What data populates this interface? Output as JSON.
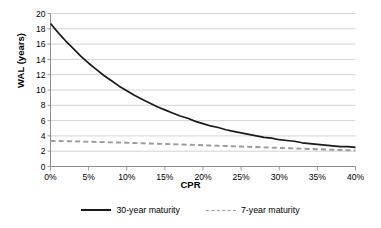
{
  "chart_data": {
    "type": "line",
    "title": "",
    "xlabel": "CPR",
    "ylabel": "WAL (years)",
    "xlim": [
      0,
      40
    ],
    "ylim": [
      0,
      20
    ],
    "xticks": [
      0,
      5,
      10,
      15,
      20,
      25,
      30,
      35,
      40
    ],
    "xticklabels": [
      "0%",
      "5%",
      "10%",
      "15%",
      "20%",
      "25%",
      "30%",
      "35%",
      "40%"
    ],
    "yticks": [
      0,
      2,
      4,
      6,
      8,
      10,
      12,
      14,
      16,
      18,
      20
    ],
    "yticklabels": [
      "0",
      "2",
      "4",
      "6",
      "8",
      "10",
      "12",
      "14",
      "16",
      "18",
      "20"
    ],
    "grid": "horizontal",
    "legend_position": "bottom",
    "x": [
      0,
      1,
      2,
      3,
      4,
      5,
      6,
      7,
      8,
      9,
      10,
      11,
      12,
      13,
      14,
      15,
      16,
      17,
      18,
      19,
      20,
      21,
      22,
      23,
      24,
      25,
      26,
      27,
      28,
      29,
      30,
      31,
      32,
      33,
      34,
      35,
      36,
      37,
      38,
      39,
      40
    ],
    "series": [
      {
        "name": "30-year maturity",
        "style": "solid",
        "color": "#1a1a1a",
        "values": [
          18.7,
          17.5,
          16.4,
          15.4,
          14.4,
          13.5,
          12.7,
          11.9,
          11.2,
          10.5,
          9.9,
          9.3,
          8.8,
          8.3,
          7.8,
          7.4,
          7.0,
          6.6,
          6.3,
          5.9,
          5.6,
          5.3,
          5.1,
          4.8,
          4.6,
          4.4,
          4.2,
          4.0,
          3.8,
          3.7,
          3.5,
          3.4,
          3.3,
          3.1,
          3.0,
          2.9,
          2.8,
          2.7,
          2.6,
          2.6,
          2.5
        ]
      },
      {
        "name": "7-year maturity",
        "style": "dashed",
        "color": "#9a9a9a",
        "values": [
          3.35,
          3.33,
          3.31,
          3.29,
          3.26,
          3.24,
          3.21,
          3.19,
          3.16,
          3.13,
          3.1,
          3.07,
          3.04,
          3.01,
          2.98,
          2.95,
          2.92,
          2.88,
          2.85,
          2.82,
          2.78,
          2.75,
          2.71,
          2.68,
          2.64,
          2.61,
          2.57,
          2.54,
          2.5,
          2.47,
          2.43,
          2.4,
          2.36,
          2.33,
          2.29,
          2.26,
          2.23,
          2.19,
          2.16,
          2.13,
          2.1
        ]
      }
    ]
  },
  "legend": {
    "items": [
      {
        "label": "30-year maturity"
      },
      {
        "label": "7-year maturity"
      }
    ]
  }
}
